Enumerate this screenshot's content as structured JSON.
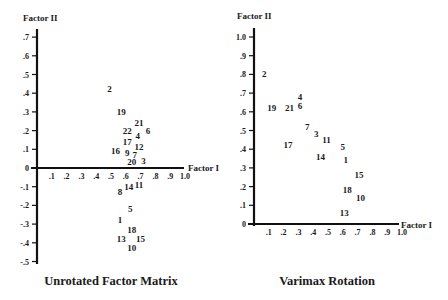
{
  "chart_data": [
    {
      "type": "scatter",
      "title": "Unrotated Factor Matrix",
      "xlabel": "Factor I",
      "ylabel": "Factor II",
      "xlim": [
        0,
        1.0
      ],
      "ylim": [
        -0.5,
        0.7
      ],
      "xticks": [
        ".1",
        ".2",
        ".3",
        ".4",
        ".5",
        ".6",
        ".7",
        ".8",
        ".9",
        "1.0"
      ],
      "yticks": [
        ".7",
        ".6",
        ".5",
        ".4",
        ".3",
        ".2",
        ".1",
        "0",
        "-.1",
        "-.2",
        "-.3",
        "-.4",
        "-.5"
      ],
      "grid": false,
      "marker": "numeric-label",
      "points": [
        {
          "label": "2",
          "x": 0.49,
          "y": 0.42
        },
        {
          "label": "19",
          "x": 0.57,
          "y": 0.3
        },
        {
          "label": "21",
          "x": 0.69,
          "y": 0.24
        },
        {
          "label": "6",
          "x": 0.75,
          "y": 0.2
        },
        {
          "label": "22",
          "x": 0.61,
          "y": 0.2
        },
        {
          "label": "4",
          "x": 0.68,
          "y": 0.17
        },
        {
          "label": "17",
          "x": 0.61,
          "y": 0.14
        },
        {
          "label": "12",
          "x": 0.69,
          "y": 0.11
        },
        {
          "label": "16",
          "x": 0.53,
          "y": 0.09
        },
        {
          "label": "9",
          "x": 0.61,
          "y": 0.08
        },
        {
          "label": "7",
          "x": 0.66,
          "y": 0.07
        },
        {
          "label": "3",
          "x": 0.72,
          "y": 0.04
        },
        {
          "label": "20",
          "x": 0.64,
          "y": 0.03
        },
        {
          "label": "11",
          "x": 0.69,
          "y": -0.09
        },
        {
          "label": "14",
          "x": 0.62,
          "y": -0.1
        },
        {
          "label": "8",
          "x": 0.56,
          "y": -0.13
        },
        {
          "label": "5",
          "x": 0.63,
          "y": -0.22
        },
        {
          "label": "1",
          "x": 0.56,
          "y": -0.28
        },
        {
          "label": "18",
          "x": 0.64,
          "y": -0.33
        },
        {
          "label": "13",
          "x": 0.57,
          "y": -0.38
        },
        {
          "label": "15",
          "x": 0.7,
          "y": -0.38
        },
        {
          "label": "10",
          "x": 0.64,
          "y": -0.43
        }
      ]
    },
    {
      "type": "scatter",
      "title": "Varimax Rotation",
      "xlabel": "Factor I",
      "ylabel": "Factor II",
      "xlim": [
        0,
        1.0
      ],
      "ylim": [
        0,
        1.0
      ],
      "xticks": [
        ".1",
        ".2",
        ".3",
        ".4",
        ".5",
        ".6",
        ".7",
        ".8",
        ".9",
        "1.0"
      ],
      "yticks": [
        "1.0",
        ".9",
        ".8",
        ".7",
        ".6",
        ".5",
        ".4",
        ".3",
        ".2",
        ".1",
        "0"
      ],
      "grid": false,
      "marker": "numeric-label",
      "points": [
        {
          "label": "2",
          "x": 0.07,
          "y": 0.8
        },
        {
          "label": "19",
          "x": 0.12,
          "y": 0.62
        },
        {
          "label": "21",
          "x": 0.24,
          "y": 0.62
        },
        {
          "label": "4",
          "x": 0.31,
          "y": 0.68
        },
        {
          "label": "6",
          "x": 0.31,
          "y": 0.63
        },
        {
          "label": "7",
          "x": 0.36,
          "y": 0.52
        },
        {
          "label": "3",
          "x": 0.42,
          "y": 0.48
        },
        {
          "label": "11",
          "x": 0.49,
          "y": 0.45
        },
        {
          "label": "17",
          "x": 0.23,
          "y": 0.42
        },
        {
          "label": "5",
          "x": 0.6,
          "y": 0.41
        },
        {
          "label": "14",
          "x": 0.45,
          "y": 0.36
        },
        {
          "label": "1",
          "x": 0.62,
          "y": 0.34
        },
        {
          "label": "15",
          "x": 0.71,
          "y": 0.26
        },
        {
          "label": "18",
          "x": 0.63,
          "y": 0.18
        },
        {
          "label": "10",
          "x": 0.72,
          "y": 0.14
        },
        {
          "label": "13",
          "x": 0.61,
          "y": 0.06
        }
      ]
    }
  ]
}
